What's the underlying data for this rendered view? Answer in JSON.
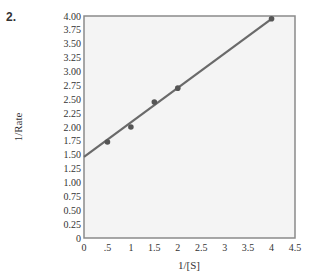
{
  "problem_number": "2.",
  "chart_data": {
    "type": "scatter",
    "title": "",
    "xlabel": "1/[S]",
    "ylabel": "1/Rate",
    "xlim": [
      0,
      4.5
    ],
    "ylim": [
      0,
      4.0
    ],
    "grid": false,
    "legend": null,
    "x_ticks": [
      "0",
      ".5",
      "1",
      "1.5",
      "2",
      "2.5",
      "3",
      "3.5",
      "4",
      "4.5"
    ],
    "x_tick_values": [
      0,
      0.5,
      1,
      1.5,
      2,
      2.5,
      3,
      3.5,
      4,
      4.5
    ],
    "y_ticks": [
      "0",
      "0.25",
      "0.50",
      "0.75",
      "1.00",
      "1.25",
      "1.50",
      "1.75",
      "2.00",
      "2.25",
      "2.50",
      "2.75",
      "3.00",
      "3.25",
      "3.50",
      "3.75",
      "4.00"
    ],
    "y_tick_values": [
      0,
      0.25,
      0.5,
      0.75,
      1.0,
      1.25,
      1.5,
      1.75,
      2.0,
      2.25,
      2.5,
      2.75,
      3.0,
      3.25,
      3.5,
      3.75,
      4.0
    ],
    "series": [
      {
        "name": "data points",
        "x": [
          0.5,
          1,
          1.5,
          2,
          4
        ],
        "y": [
          1.73,
          2.0,
          2.45,
          2.7,
          3.95
        ]
      },
      {
        "name": "fit line",
        "kind": "line",
        "x": [
          0,
          4
        ],
        "y": [
          1.46,
          3.95
        ]
      }
    ],
    "colors": {
      "plot_background": "#f4f4f4",
      "frame": "#8a8a8a",
      "line": "#6a6a6a",
      "points": "#555555"
    }
  }
}
